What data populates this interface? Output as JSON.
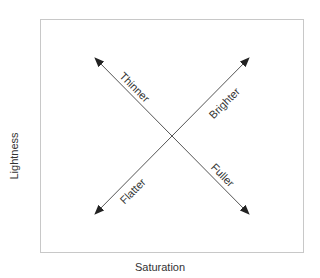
{
  "diagram": {
    "x_axis_label": "Saturation",
    "y_axis_label": "Lightness",
    "arrows": [
      {
        "label": "Thinner",
        "direction": "up-left"
      },
      {
        "label": "Brighter",
        "direction": "up-right"
      },
      {
        "label": "Flatter",
        "direction": "down-left"
      },
      {
        "label": "Fuller",
        "direction": "down-right"
      }
    ],
    "colors": {
      "line": "#555555",
      "frame": "#c8c8c8",
      "text": "#333333"
    }
  }
}
